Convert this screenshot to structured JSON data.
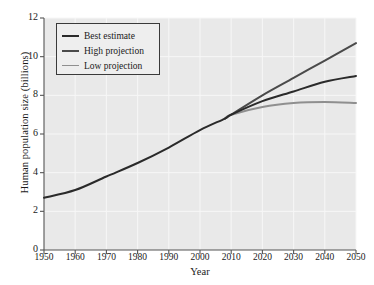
{
  "chart_data": {
    "type": "line",
    "title": "",
    "xlabel": "Year",
    "ylabel": "Human population size (billions)",
    "xlim": [
      1950,
      2050
    ],
    "ylim": [
      0,
      12
    ],
    "xticks": [
      1950,
      1960,
      1970,
      1980,
      1990,
      2000,
      2010,
      2020,
      2030,
      2040,
      2050
    ],
    "yticks": [
      0,
      2,
      4,
      6,
      8,
      10,
      12
    ],
    "grid": true,
    "legend_position": "upper-left",
    "plot_background": "#e9e9e9",
    "gridline_color": "#f7f7f7",
    "axis_color": "#555555",
    "series": [
      {
        "name": "Best estimate",
        "color": "#2a2a2a",
        "width": 2.0,
        "x": [
          1950,
          1960,
          1970,
          1980,
          1990,
          2000,
          2008,
          2010,
          2020,
          2030,
          2040,
          2050
        ],
        "values": [
          2.7,
          3.1,
          3.8,
          4.5,
          5.3,
          6.2,
          6.8,
          7.0,
          7.7,
          8.2,
          8.7,
          9.0
        ]
      },
      {
        "name": "High projection",
        "color": "#4a4a4a",
        "width": 2.0,
        "x": [
          2008,
          2010,
          2020,
          2030,
          2040,
          2050
        ],
        "values": [
          6.8,
          7.0,
          8.0,
          8.9,
          9.8,
          10.7
        ]
      },
      {
        "name": "Low projection",
        "color": "#8f8f8f",
        "width": 2.0,
        "x": [
          2008,
          2010,
          2020,
          2030,
          2040,
          2050
        ],
        "values": [
          6.8,
          7.0,
          7.4,
          7.6,
          7.65,
          7.6
        ]
      }
    ],
    "legend_entries": [
      {
        "label": "Best estimate",
        "color": "#2a2a2a",
        "width": 2.0
      },
      {
        "label": "High projection",
        "color": "#4a4a4a",
        "width": 2.0
      },
      {
        "label": "Low projection",
        "color": "#8f8f8f",
        "width": 1.6
      }
    ]
  }
}
